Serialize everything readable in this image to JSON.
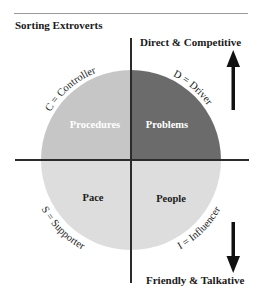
{
  "figure": {
    "title": "Sorting Extroverts",
    "poles": {
      "top": "Direct & Competitive",
      "bottom": "Friendly & Talkative"
    },
    "quadrants": [
      {
        "id": "top-left",
        "label": "Procedures",
        "type": "C",
        "type_label": "C = Controller",
        "color": "#c6c6c6"
      },
      {
        "id": "top-right",
        "label": "Problems",
        "type": "D",
        "type_label": "D = Driver",
        "color": "#6b6b6b"
      },
      {
        "id": "bottom-left",
        "label": "Pace",
        "type": "S",
        "type_label": "S = Supporter",
        "color": "#dddddd"
      },
      {
        "id": "bottom-right",
        "label": "People",
        "type": "I",
        "type_label": "I = Influencer",
        "color": "#dddddd"
      }
    ],
    "arrows": {
      "up": "arrow-up",
      "down": "arrow-down"
    },
    "colors": {
      "axis": "#2b2b2b",
      "rule": "#9a9a9a",
      "text": "#1a1a1a"
    }
  }
}
